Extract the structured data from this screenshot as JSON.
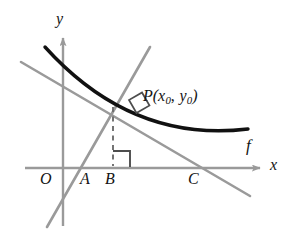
{
  "figure": {
    "kind": "math-diagram",
    "background_color": "#ffffff",
    "curve_color": "#111111",
    "line_color": "#9a9a9a",
    "axis_color": "#9a9a9a",
    "dash_color": "#6e6e6e",
    "label_color": "#141414"
  },
  "axes": {
    "x_label": "x",
    "y_label": "y",
    "origin_label": "O"
  },
  "labels": {
    "point_A": "A",
    "point_B": "B",
    "point_C": "C",
    "function": "f",
    "point_P_name": "P",
    "point_P_open": "(",
    "point_P_x": "x",
    "point_P_x_sub": "0",
    "point_P_comma": ",",
    "point_P_y": "y",
    "point_P_y_sub": "0",
    "point_P_close": ")"
  },
  "geometry": {
    "x_axis": {
      "x1": 25,
      "y1": 168,
      "x2": 262,
      "y2": 168
    },
    "y_axis": {
      "x1": 63,
      "y1": 226,
      "x2": 63,
      "y2": 36
    },
    "curve": {
      "start": [
        45,
        47
      ],
      "control1": [
        120,
        120
      ],
      "control2": [
        175,
        140
      ],
      "end": [
        248,
        129
      ]
    },
    "tangent_line": {
      "x1": 21,
      "y1": 62,
      "x2": 250,
      "y2": 196
    },
    "normal_line": {
      "x1": 150,
      "y1": 47,
      "x2": 47,
      "y2": 227
    },
    "dashed_drop": {
      "x1": 113,
      "y1": 108,
      "x2": 113,
      "y2": 167
    },
    "point_P": [
      123,
      103
    ],
    "right_angle_at_P": true,
    "right_angle_at_B": true,
    "tick_A": 87,
    "tick_B": 113,
    "tick_C": 196
  },
  "label_positions": {
    "y": {
      "left": 56,
      "top": 11
    },
    "x": {
      "left": 270,
      "top": 159
    },
    "O": {
      "left": 41,
      "top": 172
    },
    "A": {
      "left": 81,
      "top": 172
    },
    "B": {
      "left": 105,
      "top": 172
    },
    "C": {
      "left": 189,
      "top": 172
    },
    "f": {
      "left": 245,
      "top": 139
    },
    "P": {
      "left": 144,
      "top": 87
    }
  }
}
